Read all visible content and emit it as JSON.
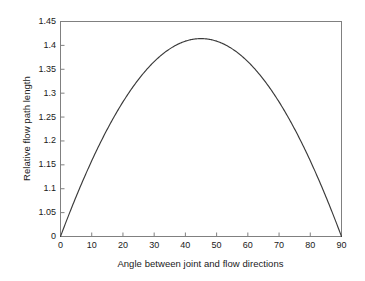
{
  "chart_data": {
    "type": "line",
    "title": "",
    "xlabel": "Angle between joint and flow directions",
    "ylabel": "Relative flow path length",
    "xlim": [
      0,
      90
    ],
    "ylim_data": [
      1.0,
      1.45
    ],
    "grid": false,
    "legend": null,
    "axis_note": "y-axis is broken: baseline is labelled 0, next tick is 1.05",
    "xticks": [
      0,
      10,
      20,
      30,
      40,
      50,
      60,
      70,
      80,
      90
    ],
    "xtick_labels": [
      "0",
      "10",
      "20",
      "30",
      "40",
      "50",
      "60",
      "70",
      "80",
      "90"
    ],
    "yticks": [
      0,
      1.05,
      1.1,
      1.15,
      1.2,
      1.25,
      1.3,
      1.35,
      1.4,
      1.45
    ],
    "ytick_labels": [
      "0",
      "1.05",
      "1.1",
      "1.15",
      "1.2",
      "1.25",
      "1.3",
      "1.35",
      "1.4",
      "1.45"
    ],
    "series": [
      {
        "name": "Relative flow path length",
        "color": "#3a3a3a",
        "x": [
          0,
          2,
          4,
          6,
          8,
          10,
          12,
          14,
          16,
          18,
          20,
          22,
          24,
          26,
          28,
          30,
          32,
          34,
          36,
          38,
          40,
          42,
          44,
          45,
          46,
          48,
          50,
          52,
          54,
          56,
          58,
          60,
          62,
          64,
          66,
          68,
          70,
          72,
          74,
          76,
          78,
          80,
          82,
          84,
          86,
          88,
          90
        ],
        "y": [
          1.0,
          1.034,
          1.067,
          1.099,
          1.129,
          1.158,
          1.186,
          1.212,
          1.236,
          1.259,
          1.279,
          1.298,
          1.315,
          1.33,
          1.343,
          1.354,
          1.363,
          1.37,
          1.376,
          1.379,
          1.38,
          1.379,
          1.376,
          1.374,
          1.376,
          1.379,
          1.38,
          1.379,
          1.376,
          1.37,
          1.363,
          1.354,
          1.343,
          1.33,
          1.315,
          1.298,
          1.279,
          1.259,
          1.236,
          1.212,
          1.186,
          1.158,
          1.129,
          1.099,
          1.067,
          1.034,
          1.0
        ],
        "peak_x": 45,
        "peak_y": 1.414
      }
    ],
    "colors": {
      "axis": "#808080",
      "curve": "#3a3a3a",
      "background": "#ffffff",
      "text": "#1a1a1a"
    }
  }
}
